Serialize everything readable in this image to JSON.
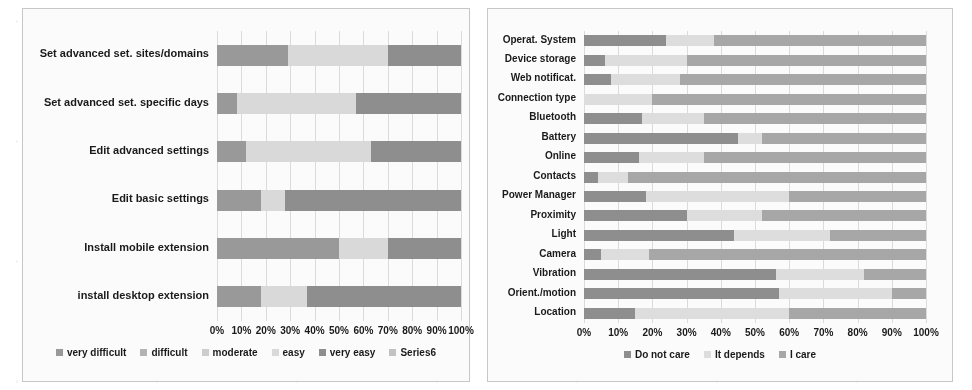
{
  "figure": {
    "panels": [
      "left-difficulty-chart",
      "right-concern-chart"
    ]
  },
  "chart_data": [
    {
      "id": "left",
      "type": "bar",
      "orientation": "horizontal",
      "stacked": true,
      "percent_stacked": true,
      "title": "",
      "xlabel": "",
      "ylabel": "",
      "xlim": [
        0,
        100
      ],
      "grid": true,
      "legend_position": "bottom",
      "tick_labels": [
        "0%",
        "10%",
        "20%",
        "30%",
        "40%",
        "50%",
        "60%",
        "70%",
        "80%",
        "90%",
        "100%"
      ],
      "tick_values": [
        0,
        10,
        20,
        30,
        40,
        50,
        60,
        70,
        80,
        90,
        100
      ],
      "categories": [
        "Set advanced set. sites/domains",
        "Set advanced set. specific days",
        "Edit advanced settings",
        "Edit basic settings",
        "Install mobile extension",
        "install desktop extension"
      ],
      "series": [
        {
          "name": "very difficult",
          "color": "#9a9a9a",
          "values": [
            29,
            8,
            12,
            18,
            50,
            18
          ]
        },
        {
          "name": "difficult",
          "color": "#b5b5b5",
          "values": [
            0,
            0,
            0,
            0,
            0,
            0
          ]
        },
        {
          "name": "moderate",
          "color": "#cfcfcf",
          "values": [
            0,
            0,
            0,
            0,
            0,
            0
          ]
        },
        {
          "name": "easy",
          "color": "#dcdcdc",
          "values": [
            41,
            49,
            51,
            10,
            20,
            19
          ]
        },
        {
          "name": "very easy",
          "color": "#8e8e8e",
          "values": [
            30,
            43,
            37,
            72,
            30,
            63
          ]
        },
        {
          "name": "Series6",
          "color": "#c4c4c4",
          "values": [
            0,
            0,
            0,
            0,
            0,
            0
          ]
        }
      ],
      "legend": [
        "very difficult",
        "difficult",
        "moderate",
        "easy",
        "very easy",
        "Series6"
      ]
    },
    {
      "id": "right",
      "type": "bar",
      "orientation": "horizontal",
      "stacked": true,
      "percent_stacked": true,
      "title": "",
      "xlabel": "",
      "ylabel": "",
      "xlim": [
        0,
        100
      ],
      "grid": true,
      "legend_position": "bottom",
      "tick_labels": [
        "0%",
        "10%",
        "20%",
        "30%",
        "40%",
        "50%",
        "60%",
        "70%",
        "80%",
        "90%",
        "100%"
      ],
      "tick_values": [
        0,
        10,
        20,
        30,
        40,
        50,
        60,
        70,
        80,
        90,
        100
      ],
      "categories": [
        "Operat. System",
        "Device storage",
        "Web notificat.",
        "Connection type",
        "Bluetooth",
        "Battery",
        "Online",
        "Contacts",
        "Power Manager",
        "Proximity",
        "Light",
        "Camera",
        "Vibration",
        "Orient./motion",
        "Location"
      ],
      "series": [
        {
          "name": "Do not care",
          "color": "#8e8e8e",
          "values": [
            24,
            6,
            8,
            0,
            17,
            45,
            16,
            4,
            18,
            30,
            44,
            5,
            56,
            57,
            15
          ]
        },
        {
          "name": "It depends",
          "color": "#e0e0e0",
          "values": [
            14,
            24,
            20,
            20,
            18,
            7,
            19,
            9,
            42,
            22,
            28,
            14,
            26,
            33,
            45
          ]
        },
        {
          "name": "I care",
          "color": "#a8a8a8",
          "values": [
            62,
            70,
            72,
            80,
            65,
            48,
            65,
            87,
            40,
            48,
            28,
            81,
            18,
            10,
            40
          ]
        }
      ],
      "legend": [
        "Do not care",
        "It depends",
        "I care"
      ]
    }
  ]
}
